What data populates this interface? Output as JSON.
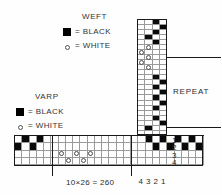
{
  "diagram": {
    "title_weft": "WEFT",
    "title_warp": "VARP",
    "weft_legend": [
      {
        "symbol": "black-square-icon",
        "label": "= BLACK"
      },
      {
        "symbol": "white-circle-icon",
        "label": "= WHITE"
      }
    ],
    "warp_legend": [
      {
        "symbol": "black-square-icon",
        "label": "= BLACK"
      },
      {
        "symbol": "white-circle-icon",
        "label": "= WHITE"
      }
    ],
    "repeat_label": "REPEAT",
    "threading_caption": "10×26 = 260",
    "treadle_numbers": [
      "4",
      "3",
      "2",
      "1"
    ],
    "harness_numbers": [
      "1",
      "2",
      "3",
      "4"
    ],
    "legend_colors": {
      "black": "#000000",
      "white": "#ffffff",
      "grid_line": "#9a9a9a",
      "frame_line": "#1a1a1a"
    }
  },
  "chart_data": {
    "type": "heatmap",
    "xlabel": "",
    "ylabel": "",
    "grid": true,
    "legend_position": "left",
    "notation": {
      "1": "black square (filled cell)",
      "0": "empty white cell",
      "2": "white circle marker"
    },
    "panels": [
      {
        "name": "treadling-column",
        "role": "weft / treadling sequence",
        "columns": 4,
        "rows": 23,
        "column_labels": [
          "4",
          "3",
          "2",
          "1"
        ],
        "cells": [
          [
            0,
            0,
            1,
            0
          ],
          [
            0,
            0,
            0,
            1
          ],
          [
            0,
            0,
            1,
            0
          ],
          [
            0,
            1,
            0,
            0
          ],
          [
            0,
            0,
            1,
            0
          ],
          [
            0,
            2,
            0,
            0
          ],
          [
            2,
            0,
            0,
            0
          ],
          [
            0,
            2,
            0,
            0
          ],
          [
            2,
            0,
            0,
            0
          ],
          [
            0,
            2,
            0,
            0
          ],
          [
            0,
            0,
            0,
            0
          ],
          [
            0,
            0,
            1,
            0
          ],
          [
            0,
            0,
            0,
            1
          ],
          [
            0,
            0,
            1,
            0
          ],
          [
            0,
            0,
            0,
            1
          ],
          [
            0,
            0,
            1,
            0
          ],
          [
            0,
            0,
            0,
            1
          ],
          [
            0,
            0,
            1,
            0
          ],
          [
            0,
            0,
            0,
            0
          ],
          [
            0,
            0,
            1,
            0
          ],
          [
            0,
            0,
            0,
            1
          ],
          [
            0,
            1,
            0,
            0
          ],
          [
            0,
            0,
            0,
            0
          ]
        ]
      },
      {
        "name": "tieup-block",
        "role": "tie-up (intersection of threading and treadling)",
        "columns": 4,
        "rows": 4,
        "column_labels": [
          "4",
          "3",
          "2",
          "1"
        ],
        "row_labels": [
          "1",
          "2",
          "3",
          "4"
        ],
        "cells": [
          [
            0,
            0,
            0,
            1
          ],
          [
            0,
            0,
            1,
            0
          ],
          [
            0,
            1,
            0,
            0
          ],
          [
            1,
            0,
            0,
            0
          ]
        ]
      },
      {
        "name": "threading-row",
        "role": "warp / threading sequence",
        "columns": 26,
        "rows": 4,
        "row_labels": [
          "1",
          "2",
          "3",
          "4"
        ],
        "cells": [
          [
            0,
            1,
            0,
            1,
            0,
            0,
            0,
            0,
            0,
            0,
            0,
            0,
            0,
            0,
            0,
            0,
            0,
            0,
            1,
            0,
            1,
            0,
            1,
            0,
            1,
            0
          ],
          [
            1,
            0,
            1,
            0,
            0,
            0,
            0,
            0,
            0,
            0,
            0,
            0,
            0,
            0,
            0,
            0,
            0,
            0,
            0,
            1,
            0,
            1,
            0,
            1,
            0,
            1
          ],
          [
            0,
            0,
            0,
            0,
            0,
            0,
            2,
            0,
            2,
            0,
            2,
            0,
            0,
            0,
            0,
            0,
            0,
            0,
            0,
            0,
            0,
            0,
            0,
            0,
            0,
            0
          ],
          [
            0,
            0,
            0,
            0,
            0,
            0,
            0,
            2,
            0,
            2,
            0,
            0,
            0,
            0,
            0,
            0,
            0,
            0,
            0,
            0,
            0,
            0,
            0,
            0,
            0,
            0
          ]
        ]
      }
    ]
  }
}
